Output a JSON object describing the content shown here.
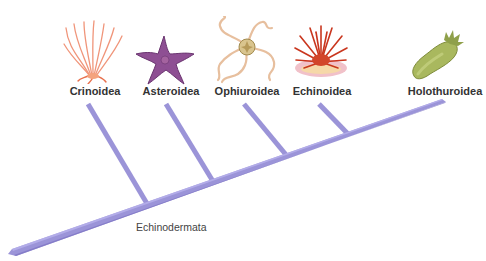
{
  "diagram": {
    "type": "cladogram",
    "clade": "Echinodermata",
    "branch_color": "#9b94d8",
    "branch_shadow": "#7d75c2",
    "taxa": [
      {
        "label": "Crinoidea",
        "common": "sea lily",
        "icon": "crinoid-icon",
        "label_x": 95
      },
      {
        "label": "Asteroidea",
        "common": "sea star",
        "icon": "sea-star-icon",
        "label_x": 171
      },
      {
        "label": "Ophiuroidea",
        "common": "brittle star",
        "icon": "brittle-star-icon",
        "label_x": 247
      },
      {
        "label": "Echinoidea",
        "common": "sea urchin",
        "icon": "sea-urchin-icon",
        "label_x": 321
      },
      {
        "label": "Holothuroidea",
        "common": "sea cucumber",
        "icon": "sea-cucumber-icon",
        "label_x": 445
      }
    ]
  }
}
